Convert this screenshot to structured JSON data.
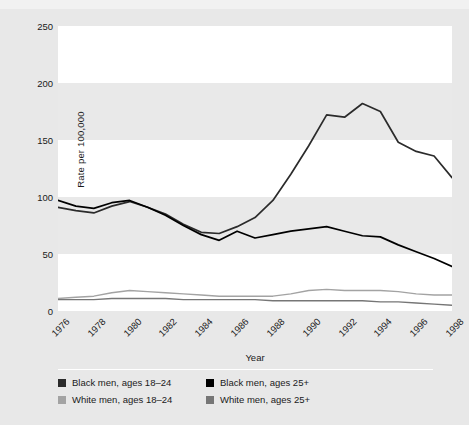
{
  "figure": {
    "background_color": "#e8e8e8",
    "plot_background_color": "#e9e9e9",
    "band_color": "#ffffff",
    "title_sliver": ""
  },
  "axes": {
    "ylabel": "Rate per 100,000",
    "xlabel": "Year",
    "yticks": [
      "250",
      "200",
      "150",
      "100",
      "50",
      "0"
    ],
    "xticks": [
      "1976",
      "1978",
      "1980",
      "1982",
      "1984",
      "1986",
      "1988",
      "1990",
      "1992",
      "1994",
      "1996",
      "1998"
    ]
  },
  "legend": {
    "items": [
      {
        "label": "Black men, ages 18–24",
        "color": "#2b2b2b"
      },
      {
        "label": "Black men, ages 25+",
        "color": "#000000"
      },
      {
        "label": "White men, ages 18–24",
        "color": "#a3a3a3"
      },
      {
        "label": "White men, ages 25+",
        "color": "#767676"
      }
    ]
  },
  "chart_data": {
    "type": "line",
    "title": "",
    "xlabel": "Year",
    "ylabel": "Rate per 100,000",
    "xlim": [
      1976,
      1998
    ],
    "ylim": [
      0,
      250
    ],
    "yticks": [
      0,
      50,
      100,
      150,
      200,
      250
    ],
    "xticks": [
      1976,
      1978,
      1980,
      1982,
      1984,
      1986,
      1988,
      1990,
      1992,
      1994,
      1996,
      1998
    ],
    "grid": false,
    "banded_background": true,
    "legend_position": "below-axes",
    "x": [
      1976,
      1977,
      1978,
      1979,
      1980,
      1981,
      1982,
      1983,
      1984,
      1985,
      1986,
      1987,
      1988,
      1989,
      1990,
      1991,
      1992,
      1993,
      1994,
      1995,
      1996,
      1997,
      1998
    ],
    "series": [
      {
        "name": "Black men, ages 18–24",
        "color": "#2b2b2b",
        "values": [
          91,
          88,
          86,
          92,
          96,
          91,
          85,
          76,
          69,
          68,
          74,
          82,
          97,
          120,
          145,
          172,
          170,
          182,
          175,
          148,
          140,
          136,
          117
        ]
      },
      {
        "name": "Black men, ages 25+",
        "color": "#000000",
        "values": [
          97,
          92,
          90,
          95,
          97,
          91,
          84,
          75,
          67,
          62,
          70,
          64,
          67,
          70,
          72,
          74,
          70,
          66,
          65,
          58,
          52,
          46,
          39
        ]
      },
      {
        "name": "White men, ages 18–24",
        "color": "#a3a3a3",
        "values": [
          11,
          12,
          13,
          16,
          18,
          17,
          16,
          15,
          14,
          13,
          13,
          13,
          13,
          15,
          18,
          19,
          18,
          18,
          18,
          17,
          15,
          14,
          14
        ]
      },
      {
        "name": "White men, ages 25+",
        "color": "#767676",
        "values": [
          10,
          10,
          10,
          11,
          11,
          11,
          11,
          10,
          10,
          10,
          10,
          10,
          9,
          9,
          9,
          9,
          9,
          9,
          8,
          8,
          7,
          6,
          5
        ]
      }
    ]
  }
}
